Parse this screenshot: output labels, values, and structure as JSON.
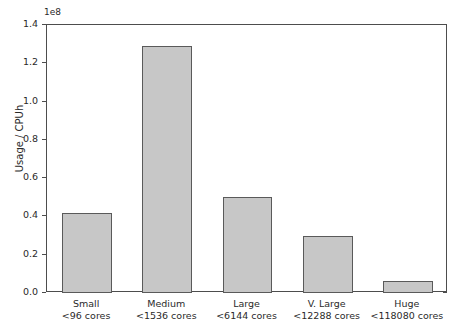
{
  "chart_data": {
    "type": "bar",
    "title": "",
    "xlabel": "",
    "ylabel": "Usage / CPUh",
    "y_offset_label": "1e8",
    "y_offset_multiplier": 100000000,
    "ylim": [
      0,
      140000000
    ],
    "ytick_labels": [
      "0.0",
      "0.2",
      "0.4",
      "0.6",
      "0.8",
      "1.0",
      "1.2",
      "1.4"
    ],
    "ytick_values": [
      0,
      20000000,
      40000000,
      60000000,
      80000000,
      100000000,
      120000000,
      140000000
    ],
    "grid": false,
    "legend": null,
    "bar_color": "#c7c7c7",
    "bar_edge_color": "#5a5a5a",
    "categories": [
      "Small\n<96 cores",
      "Medium\n<1536 cores",
      "Large\n<6144 cores",
      "V. Large\n<12288 cores",
      "Huge\n<118080 cores"
    ],
    "category_names": [
      "Small",
      "Medium",
      "Large",
      "V. Large",
      "Huge"
    ],
    "category_subtitles": [
      "<96 cores",
      "<1536 cores",
      "<6144 cores",
      "<12288 cores",
      "<118080 cores"
    ],
    "values": [
      42000000,
      129000000,
      50000000,
      30000000,
      6300000
    ]
  },
  "axis": {
    "ylabel": "Usage / CPUh",
    "offset_text": "1e8"
  },
  "yticks": [
    {
      "label": "1.4",
      "value": 140000000
    },
    {
      "label": "1.2",
      "value": 120000000
    },
    {
      "label": "1.0",
      "value": 100000000
    },
    {
      "label": "0.8",
      "value": 80000000
    },
    {
      "label": "0.6",
      "value": 60000000
    },
    {
      "label": "0.4",
      "value": 40000000
    },
    {
      "label": "0.2",
      "value": 20000000
    },
    {
      "label": "0.0",
      "value": 0
    }
  ],
  "bars": [
    {
      "name": "Small",
      "sub": "<96 cores",
      "value": 42000000
    },
    {
      "name": "Medium",
      "sub": "<1536 cores",
      "value": 129000000
    },
    {
      "name": "Large",
      "sub": "<6144 cores",
      "value": 50000000
    },
    {
      "name": "V. Large",
      "sub": "<12288 cores",
      "value": 30000000
    },
    {
      "name": "Huge",
      "sub": "<118080 cores",
      "value": 6300000
    }
  ]
}
